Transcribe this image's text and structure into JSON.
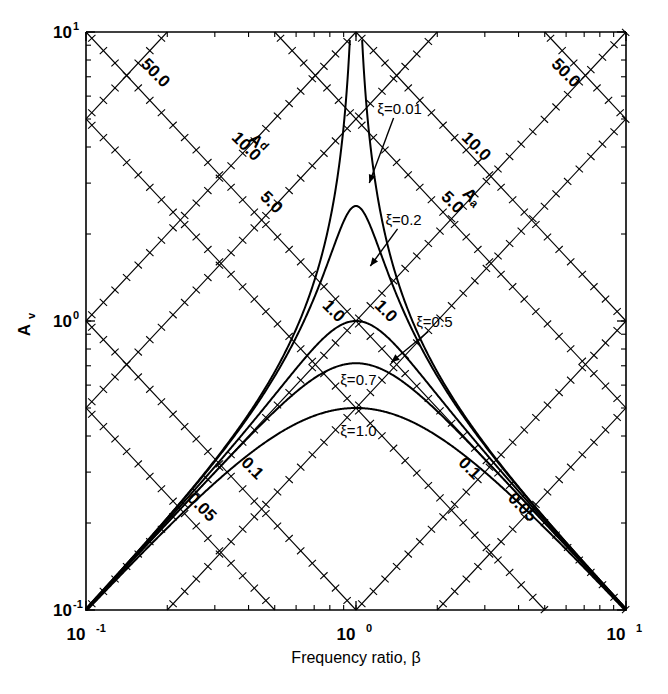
{
  "chart_data": {
    "type": "line",
    "title": "",
    "xlabel": "Frequency ratio, β",
    "ylabel": "Aᵥ",
    "xscale": "log",
    "yscale": "log",
    "xlim": [
      0.1,
      10
    ],
    "ylim": [
      0.1,
      10
    ],
    "x_tick_labels": [
      "10⁻¹",
      "10⁰",
      "10¹"
    ],
    "x_tick_values": [
      0.1,
      1,
      10
    ],
    "y_tick_labels": [
      "10⁻¹",
      "10⁰",
      "10¹"
    ],
    "y_tick_values": [
      0.1,
      1,
      10
    ],
    "grid": "tripartite-diagonal",
    "legend": "inline-annotations",
    "region_labels": [
      {
        "text": "Aᵈ",
        "meaning": "displacement-amplification-region",
        "x": 0.42,
        "y": 4.0
      },
      {
        "text": "Aₐ",
        "meaning": "acceleration-amplification-region",
        "x": 2.6,
        "y": 2.6
      }
    ],
    "diagonal_grid_up": {
      "description": "Acceleration grid lines, slope +1 on log-log (A_a = A_v * beta)",
      "labels": [
        "0.05",
        "0.1",
        "1.0",
        "5.0",
        "10.0",
        "50.0"
      ],
      "label_positions": [
        {
          "text": "0.05",
          "x": 4.0,
          "y": 0.22
        },
        {
          "text": "0.1",
          "x": 2.55,
          "y": 0.3
        },
        {
          "text": "1.0",
          "x": 0.8,
          "y": 1.05
        },
        {
          "text": "5.0",
          "x": 0.47,
          "y": 2.5
        },
        {
          "text": "10.0",
          "x": 0.38,
          "y": 3.9
        },
        {
          "text": "50.0",
          "x": 0.175,
          "y": 7.0
        }
      ]
    },
    "diagonal_grid_down": {
      "description": "Displacement grid lines, slope -1 on log-log (A_d = A_v / beta)",
      "labels": [
        "0.05",
        "0.1",
        "1.0",
        "5.0",
        "10.0",
        "50.0"
      ],
      "label_positions": [
        {
          "text": "0.05",
          "x": 0.26,
          "y": 0.22
        },
        {
          "text": "0.1",
          "x": 0.4,
          "y": 0.3
        },
        {
          "text": "1.0",
          "x": 1.25,
          "y": 1.05
        },
        {
          "text": "5.0",
          "x": 2.2,
          "y": 2.5
        },
        {
          "text": "10.0",
          "x": 2.7,
          "y": 3.9
        },
        {
          "text": "50.0",
          "x": 5.8,
          "y": 7.0
        }
      ]
    },
    "series": [
      {
        "name": "ξ=0.01",
        "damping": 0.01,
        "peak_x": 1.0,
        "peak_y": 50.0,
        "annotation": "ξ=0.01"
      },
      {
        "name": "ξ=0.2",
        "damping": 0.2,
        "peak_x": 1.0,
        "peak_y": 2.5,
        "annotation": "ξ=0.2"
      },
      {
        "name": "ξ=0.5",
        "damping": 0.5,
        "peak_x": 1.0,
        "peak_y": 1.0,
        "annotation": "ξ=0.5"
      },
      {
        "name": "ξ=0.7",
        "damping": 0.7,
        "peak_x": 1.0,
        "peak_y": 0.714,
        "annotation": "ξ=0.7"
      },
      {
        "name": "ξ=1.0",
        "damping": 1.0,
        "peak_x": 1.0,
        "peak_y": 0.5,
        "annotation": "ξ=1.0"
      }
    ],
    "annotations": [
      {
        "text": "ξ=0.01",
        "x": 1.45,
        "y": 5.2,
        "arrow_to": {
          "x": 1.12,
          "y": 3.0
        }
      },
      {
        "text": "ξ=0.2",
        "x": 1.5,
        "y": 2.15,
        "arrow_to": {
          "x": 1.13,
          "y": 1.55
        }
      },
      {
        "text": "ξ=0.5",
        "x": 1.95,
        "y": 0.95,
        "arrow_to": {
          "x": 1.35,
          "y": 0.72
        }
      },
      {
        "text": "ξ=0.7",
        "x": 1.02,
        "y": 0.6,
        "arrow_to": null
      },
      {
        "text": "ξ=1.0",
        "x": 1.02,
        "y": 0.4,
        "arrow_to": null
      }
    ]
  },
  "axes": {
    "x_title": "Frequency ratio, β",
    "y_title": "A",
    "y_title_sub": "v",
    "x_ticks": [
      {
        "mantissa": "10",
        "exponent": "-1"
      },
      {
        "mantissa": "10",
        "exponent": "0"
      },
      {
        "mantissa": "10",
        "exponent": "1"
      }
    ],
    "y_ticks": [
      {
        "mantissa": "10",
        "exponent": "-1"
      },
      {
        "mantissa": "10",
        "exponent": "0"
      },
      {
        "mantissa": "10",
        "exponent": "1"
      }
    ]
  },
  "colors": {
    "ink": "#000000",
    "background": "#ffffff"
  }
}
